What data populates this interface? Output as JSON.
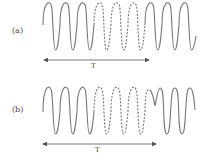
{
  "panels": [
    {
      "id": "a",
      "label": "(a)",
      "period_label": "T",
      "description": "Sinusoid with 3 solid cycles, 3 dashed cycles, 3 solid cycles; phase-continuous"
    },
    {
      "id": "b",
      "label": "(b)",
      "period_label": "T",
      "description": "Sinusoid with 3 solid cycles, 3 dashed cycles, then a phase discontinuity followed by solid cycles"
    }
  ],
  "colors": {
    "stroke": "#777777",
    "text": "#444444"
  }
}
